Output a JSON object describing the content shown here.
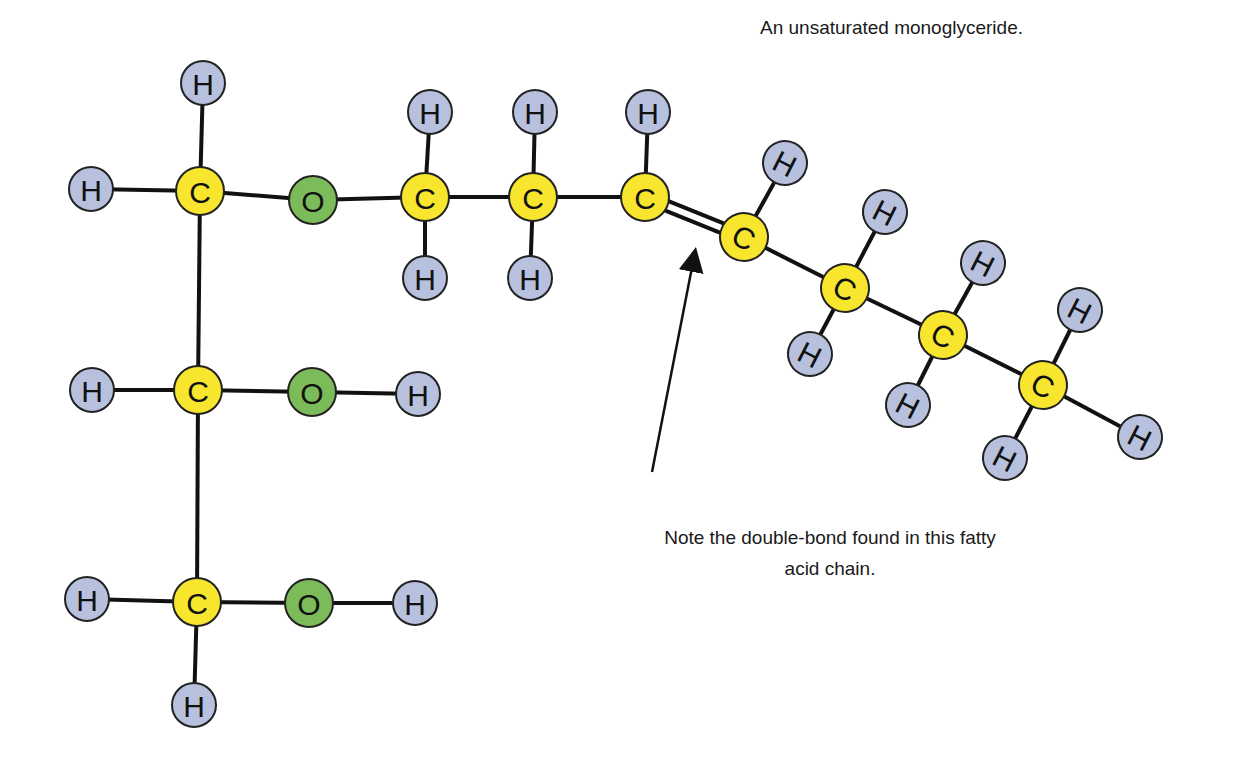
{
  "title": "An unsaturated monoglyceride.",
  "note": {
    "line1": "Note the double-bond found in this fatty",
    "line2": "acid chain."
  },
  "colors": {
    "carbon": "#f7e52e",
    "oxygen": "#7cbb5a",
    "hydrogen": "#b7c0dc",
    "bond": "#111111",
    "outline": "#222222"
  },
  "atoms": [
    {
      "id": "H1",
      "el": "H",
      "x": 203,
      "y": 83,
      "rot": 0
    },
    {
      "id": "H2",
      "el": "H",
      "x": 91,
      "y": 189,
      "rot": 0
    },
    {
      "id": "C1",
      "el": "C",
      "x": 200,
      "y": 191,
      "rot": 0
    },
    {
      "id": "O1",
      "el": "O",
      "x": 313,
      "y": 200,
      "rot": 0
    },
    {
      "id": "C4",
      "el": "C",
      "x": 425,
      "y": 197,
      "rot": 0
    },
    {
      "id": "H3",
      "el": "H",
      "x": 430,
      "y": 112,
      "rot": 0
    },
    {
      "id": "H4",
      "el": "H",
      "x": 425,
      "y": 278,
      "rot": 0
    },
    {
      "id": "C5",
      "el": "C",
      "x": 533,
      "y": 197,
      "rot": 0
    },
    {
      "id": "H5",
      "el": "H",
      "x": 535,
      "y": 112,
      "rot": 0
    },
    {
      "id": "H6",
      "el": "H",
      "x": 530,
      "y": 278,
      "rot": 0
    },
    {
      "id": "C6",
      "el": "C",
      "x": 645,
      "y": 197,
      "rot": 0
    },
    {
      "id": "H7",
      "el": "H",
      "x": 648,
      "y": 112,
      "rot": 0
    },
    {
      "id": "C7",
      "el": "C",
      "x": 744,
      "y": 237,
      "rot": 27
    },
    {
      "id": "H8",
      "el": "H",
      "x": 785,
      "y": 163,
      "rot": 27
    },
    {
      "id": "C8",
      "el": "C",
      "x": 845,
      "y": 288,
      "rot": 27
    },
    {
      "id": "H9",
      "el": "H",
      "x": 885,
      "y": 212,
      "rot": 27
    },
    {
      "id": "H10",
      "el": "H",
      "x": 810,
      "y": 354,
      "rot": 27
    },
    {
      "id": "C9",
      "el": "C",
      "x": 943,
      "y": 335,
      "rot": 27
    },
    {
      "id": "H11",
      "el": "H",
      "x": 983,
      "y": 263,
      "rot": 27
    },
    {
      "id": "H12",
      "el": "H",
      "x": 908,
      "y": 405,
      "rot": 27
    },
    {
      "id": "C10",
      "el": "C",
      "x": 1043,
      "y": 385,
      "rot": 27
    },
    {
      "id": "H13",
      "el": "H",
      "x": 1080,
      "y": 310,
      "rot": 27
    },
    {
      "id": "H14",
      "el": "H",
      "x": 1005,
      "y": 458,
      "rot": 27
    },
    {
      "id": "H15",
      "el": "H",
      "x": 1140,
      "y": 437,
      "rot": 27
    },
    {
      "id": "H16",
      "el": "H",
      "x": 92,
      "y": 390,
      "rot": 0
    },
    {
      "id": "C2",
      "el": "C",
      "x": 198,
      "y": 390,
      "rot": 0
    },
    {
      "id": "O2",
      "el": "O",
      "x": 312,
      "y": 392,
      "rot": 0
    },
    {
      "id": "H17",
      "el": "H",
      "x": 418,
      "y": 394,
      "rot": 0
    },
    {
      "id": "H18",
      "el": "H",
      "x": 87,
      "y": 599,
      "rot": 0
    },
    {
      "id": "C3",
      "el": "C",
      "x": 197,
      "y": 602,
      "rot": 0
    },
    {
      "id": "O3",
      "el": "O",
      "x": 309,
      "y": 603,
      "rot": 0
    },
    {
      "id": "H19",
      "el": "H",
      "x": 415,
      "y": 603,
      "rot": 0
    },
    {
      "id": "H20",
      "el": "H",
      "x": 194,
      "y": 705,
      "rot": 0
    }
  ],
  "bonds": [
    [
      "C1",
      "H1",
      1
    ],
    [
      "C1",
      "H2",
      1
    ],
    [
      "C1",
      "O1",
      1
    ],
    [
      "O1",
      "C4",
      1
    ],
    [
      "C4",
      "H3",
      1
    ],
    [
      "C4",
      "H4",
      1
    ],
    [
      "C4",
      "C5",
      1
    ],
    [
      "C5",
      "H5",
      1
    ],
    [
      "C5",
      "H6",
      1
    ],
    [
      "C5",
      "C6",
      1
    ],
    [
      "C6",
      "H7",
      1
    ],
    [
      "C6",
      "C7",
      2
    ],
    [
      "C7",
      "H8",
      1
    ],
    [
      "C7",
      "C8",
      1
    ],
    [
      "C8",
      "H9",
      1
    ],
    [
      "C8",
      "H10",
      1
    ],
    [
      "C8",
      "C9",
      1
    ],
    [
      "C9",
      "H11",
      1
    ],
    [
      "C9",
      "H12",
      1
    ],
    [
      "C9",
      "C10",
      1
    ],
    [
      "C10",
      "H13",
      1
    ],
    [
      "C10",
      "H14",
      1
    ],
    [
      "C10",
      "H15",
      1
    ],
    [
      "C1",
      "C2",
      1
    ],
    [
      "C2",
      "H16",
      1
    ],
    [
      "C2",
      "O2",
      1
    ],
    [
      "O2",
      "H17",
      1
    ],
    [
      "C2",
      "C3",
      1
    ],
    [
      "C3",
      "H18",
      1
    ],
    [
      "C3",
      "O3",
      1
    ],
    [
      "O3",
      "H19",
      1
    ],
    [
      "C3",
      "H20",
      1
    ]
  ],
  "arrow": {
    "x1": 652,
    "y1": 472,
    "x2": 695,
    "y2": 252
  },
  "atom_radius": 24
}
